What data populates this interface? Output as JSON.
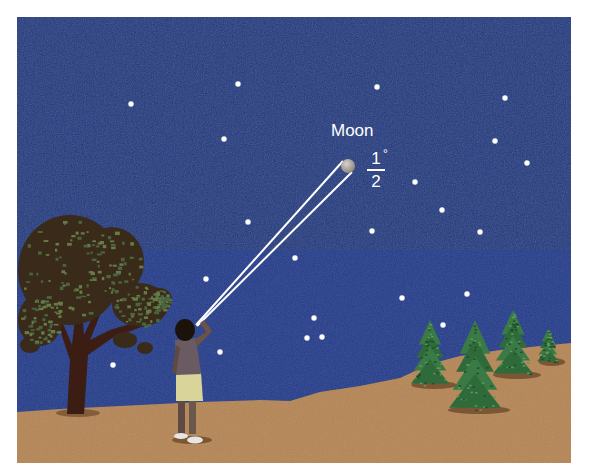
{
  "scene": {
    "description": "Night sky illustration: a person looking at the Moon, which subtends half a degree",
    "colors": {
      "sky": "#1c3b82",
      "ground": "#b58652",
      "tree_trunk": "#3b1d14",
      "pine": "#2f6b3a",
      "star": "#ffffff",
      "moon": "#bdb7ad"
    },
    "frame": {
      "x": 17,
      "y": 17,
      "width": 554,
      "height": 446
    }
  },
  "labels": {
    "moon": "Moon",
    "angle_numerator": "1",
    "angle_degree_symbol": "°",
    "angle_denominator": "2"
  },
  "moon": {
    "cx": 348,
    "cy": 166,
    "r": 7
  },
  "observer_eye": {
    "x": 196,
    "y": 325
  },
  "stars": [
    {
      "x": 131,
      "y": 104
    },
    {
      "x": 238,
      "y": 84
    },
    {
      "x": 224,
      "y": 139
    },
    {
      "x": 377,
      "y": 87
    },
    {
      "x": 505,
      "y": 98
    },
    {
      "x": 495,
      "y": 141
    },
    {
      "x": 527,
      "y": 163
    },
    {
      "x": 415,
      "y": 182
    },
    {
      "x": 442,
      "y": 210
    },
    {
      "x": 480,
      "y": 232
    },
    {
      "x": 248,
      "y": 222
    },
    {
      "x": 372,
      "y": 231
    },
    {
      "x": 295,
      "y": 258
    },
    {
      "x": 206,
      "y": 279
    },
    {
      "x": 402,
      "y": 298
    },
    {
      "x": 467,
      "y": 294
    },
    {
      "x": 314,
      "y": 318
    },
    {
      "x": 307,
      "y": 338
    },
    {
      "x": 322,
      "y": 337
    },
    {
      "x": 443,
      "y": 325
    },
    {
      "x": 220,
      "y": 352
    },
    {
      "x": 113,
      "y": 365
    }
  ],
  "pines": [
    {
      "x": 430,
      "base": 385,
      "h": 65,
      "w": 38
    },
    {
      "x": 475,
      "base": 410,
      "h": 90,
      "w": 52
    },
    {
      "x": 513,
      "base": 375,
      "h": 65,
      "w": 40
    },
    {
      "x": 548,
      "base": 362,
      "h": 33,
      "w": 22
    }
  ]
}
